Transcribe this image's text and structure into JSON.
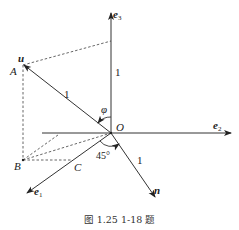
{
  "diagram": {
    "type": "vector-figure",
    "points": {
      "O": "O",
      "A": "A",
      "B": "B",
      "C": "C"
    },
    "vectors": {
      "e1": {
        "base": "e",
        "sub": "1"
      },
      "e2": {
        "base": "e",
        "sub": "2"
      },
      "e3": {
        "base": "e",
        "sub": "3"
      },
      "u": "u",
      "n": "n"
    },
    "lengths": {
      "e3_segment": "1",
      "u_segment": "1",
      "n_segment": "1"
    },
    "angles": {
      "phi": "φ",
      "deg45": "45°"
    },
    "colors": {
      "line": "#333333",
      "dashed": "#555555",
      "background": "#ffffff"
    }
  },
  "caption": "图 1.25    1-18 题"
}
